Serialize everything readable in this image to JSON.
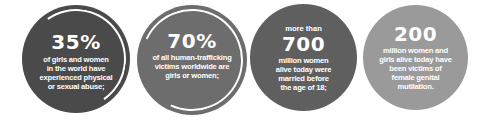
{
  "colors": {
    "circle1": "#4a4a4a",
    "circle2": "#6d6d6d",
    "circle3": "#5f5f5f",
    "circle4": "#9a9a9a",
    "text": "#ffffff",
    "ring": "#ffffff"
  },
  "stats": [
    {
      "value": "35%",
      "text_lines": [
        "of girls and women",
        "in the world have",
        "experienced physical",
        "or sexual abuse;"
      ]
    },
    {
      "value": "70%",
      "text_lines": [
        "of all human-trafficking",
        "victims worldwide are",
        "girls or women;"
      ]
    },
    {
      "prefix": "more than",
      "value": "700",
      "text_lines": [
        "million women",
        "alive today were",
        "married before",
        "the age of 18;"
      ]
    },
    {
      "value": "200",
      "text_lines": [
        "million women and",
        "girls alive today have",
        "been victims of",
        "female genital",
        "mutilation."
      ]
    }
  ]
}
